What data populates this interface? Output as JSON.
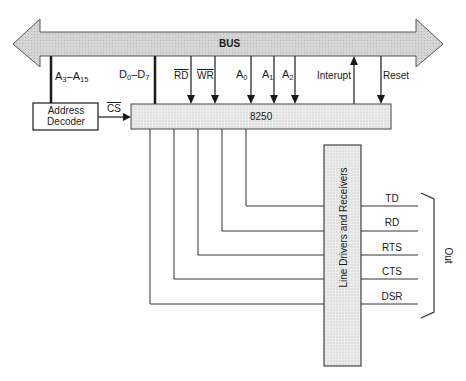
{
  "diagram": {
    "bus": {
      "label": "BUS",
      "fill": "#d4d4d4"
    },
    "address_decoder": {
      "label_line1": "Address",
      "label_line2": "Decoder"
    },
    "chip": {
      "label": "8250",
      "fill": "#e6e6e6"
    },
    "line_drivers": {
      "label": "Line  Drivers  and  Receivers",
      "fill": "#e6e6e6"
    },
    "bus_signals": {
      "addr_high": {
        "main": "A",
        "sub1": "3",
        "dash": "–A",
        "sub2": "15"
      },
      "data": {
        "main": "D",
        "sub1": "0",
        "dash": "–D",
        "sub2": "7"
      },
      "rd": "RD",
      "wr": "WR",
      "a0": {
        "main": "A",
        "sub": "0"
      },
      "a1": {
        "main": "A",
        "sub": "1"
      },
      "a2": {
        "main": "A",
        "sub": "2"
      },
      "interrupt": "Interupt",
      "reset": "Reset"
    },
    "cs_label": "CS",
    "serial_signals": [
      "TD",
      "RD",
      "RTS",
      "CTS",
      "DSR"
    ],
    "out_label": "Out"
  }
}
